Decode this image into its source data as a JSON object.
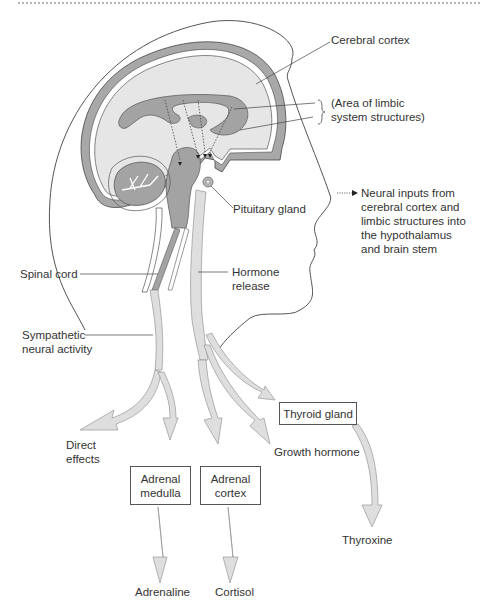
{
  "diagram": {
    "labels": {
      "cerebral_cortex": "Cerebral cortex",
      "limbic_line1": "(Area of limbic",
      "limbic_line2": "system structures)",
      "legend_line1": "Neural inputs from",
      "legend_line2": "cerebral cortex and",
      "legend_line3": "limbic structures into",
      "legend_line4": "the hypothalamus",
      "legend_line5": "and brain stem",
      "pituitary_gland": "Pituitary gland",
      "spinal_cord": "Spinal cord",
      "hormone_release_line1": "Hormone",
      "hormone_release_line2": "release",
      "sympathetic_line1": "Sympathetic",
      "sympathetic_line2": "neural activity",
      "direct_effects_line1": "Direct",
      "direct_effects_line2": "effects",
      "growth_hormone": "Growth hormone",
      "thyroxine": "Thyroxine",
      "adrenaline": "Adrenaline",
      "cortisol": "Cortisol"
    },
    "boxes": {
      "thyroid_gland": "Thyroid gland",
      "adrenal_medulla_line1": "Adrenal",
      "adrenal_medulla_line2": "medulla",
      "adrenal_cortex_line1": "Adrenal",
      "adrenal_cortex_line2": "cortex"
    },
    "icons": {
      "legend_arrow": "dotted-arrow-icon",
      "brace": "curly-brace-icon"
    },
    "colors": {
      "brain_fill": "#e6e6e6",
      "cortex_band": "#a8a8a8",
      "limbic_fill": "#a3a3a3",
      "pathway_fill": "#dedede",
      "outline": "#444444"
    }
  }
}
